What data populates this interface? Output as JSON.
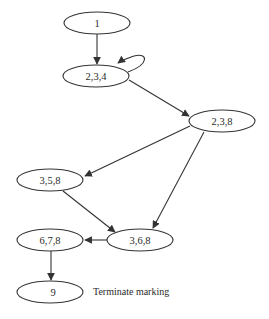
{
  "diagram": {
    "type": "reachability-graph",
    "nodes": [
      {
        "id": "n1",
        "label": "1",
        "cx": 97,
        "cy": 23,
        "rx": 33,
        "ry": 11
      },
      {
        "id": "n234",
        "label": "2,3,4",
        "cx": 96,
        "cy": 76,
        "rx": 33,
        "ry": 11
      },
      {
        "id": "n238",
        "label": "2,3,8",
        "cx": 222,
        "cy": 121,
        "rx": 33,
        "ry": 11
      },
      {
        "id": "n358",
        "label": "3,5,8",
        "cx": 50,
        "cy": 180,
        "rx": 33,
        "ry": 11
      },
      {
        "id": "n368",
        "label": "3,6,8",
        "cx": 140,
        "cy": 240,
        "rx": 33,
        "ry": 11
      },
      {
        "id": "n678",
        "label": "6,7,8",
        "cx": 50,
        "cy": 240,
        "rx": 33,
        "ry": 11
      },
      {
        "id": "n9",
        "label": "9",
        "cx": 50,
        "cy": 292,
        "rx": 33,
        "ry": 11
      }
    ],
    "edges": [
      {
        "from": "1",
        "to": "2,3,4"
      },
      {
        "from": "2,3,4",
        "to": "2,3,4",
        "type": "self-loop"
      },
      {
        "from": "2,3,4",
        "to": "2,3,8"
      },
      {
        "from": "2,3,8",
        "to": "3,5,8"
      },
      {
        "from": "2,3,8",
        "to": "3,6,8"
      },
      {
        "from": "3,5,8",
        "to": "3,6,8"
      },
      {
        "from": "3,6,8",
        "to": "6,7,8"
      },
      {
        "from": "6,7,8",
        "to": "9"
      }
    ],
    "annotation": {
      "text": "Terminate marking",
      "attached_to": "9"
    },
    "colors": {
      "stroke": "#333333",
      "text": "#2a2a2a",
      "background": "#ffffff"
    }
  }
}
